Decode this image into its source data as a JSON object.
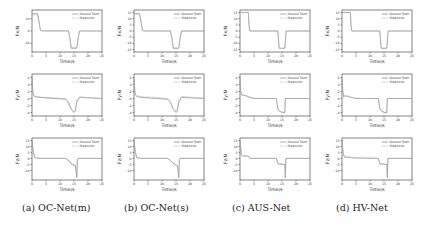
{
  "figure": {
    "captions": [
      "(a) OC-Net(m)",
      "(b) OC-Net(s)",
      "(c) AUS-Net",
      "(d) HV-Net"
    ],
    "legend": {
      "ground_truth": "Ground Truth",
      "prediction": "Prediction"
    },
    "xlabel": "Time/s",
    "row_ylabels": [
      "Fx/N",
      "Fy/N",
      "Fz/N"
    ]
  },
  "chart_data": [
    {
      "type": "line",
      "panel": "a",
      "row": 0,
      "title": "",
      "xlabel": "Time/s",
      "ylabel": "Fx/N",
      "xlim": [
        0,
        25
      ],
      "ylim": [
        -17,
        17
      ],
      "xticks": [
        0,
        5,
        10,
        15,
        20,
        25
      ],
      "yticks": [
        -10,
        0,
        10
      ],
      "series": [
        {
          "name": "Ground Truth",
          "x": [
            0,
            2,
            2.5,
            3,
            3.5,
            13,
            13.5,
            14,
            16,
            16.5,
            17,
            25
          ],
          "y": [
            14,
            14,
            8,
            0.5,
            0,
            0,
            -5,
            -14,
            -14,
            -5,
            0,
            0
          ]
        },
        {
          "name": "Prediction",
          "x": [
            0,
            2,
            2.5,
            3,
            3.5,
            13,
            13.5,
            14,
            16,
            16.5,
            17,
            25
          ],
          "y": [
            13,
            13,
            7,
            1,
            0.3,
            0.3,
            -5,
            -13,
            -13.5,
            -6,
            0.2,
            0
          ]
        }
      ]
    },
    {
      "type": "line",
      "panel": "a",
      "row": 1,
      "xlabel": "Time/s",
      "ylabel": "Fy/N",
      "xlim": [
        0,
        25
      ],
      "ylim": [
        -5,
        7
      ],
      "xticks": [
        0,
        5,
        10,
        15,
        20,
        25
      ],
      "yticks": [
        -4,
        -2,
        0,
        2,
        4,
        6
      ],
      "series": [
        {
          "name": "Ground Truth",
          "x": [
            0,
            0.3,
            0.6,
            1,
            3,
            8,
            12,
            13,
            14,
            15,
            15.5,
            16,
            17,
            25
          ],
          "y": [
            6,
            2,
            1,
            0.5,
            0.3,
            0,
            -0.2,
            -1,
            -3,
            -4,
            -3.5,
            -1,
            0.3,
            0
          ]
        },
        {
          "name": "Prediction",
          "x": [
            0,
            0.3,
            0.6,
            1,
            3,
            8,
            12,
            13,
            14,
            15,
            15.5,
            16,
            17,
            25
          ],
          "y": [
            5,
            1.5,
            0.8,
            0.7,
            0.4,
            0.2,
            0,
            -1.5,
            -3.2,
            -3.8,
            -3,
            -0.5,
            0.5,
            0
          ]
        }
      ]
    },
    {
      "type": "line",
      "panel": "a",
      "row": 2,
      "xlabel": "Time/s",
      "ylabel": "Fz/N",
      "xlim": [
        0,
        25
      ],
      "ylim": [
        -18,
        17
      ],
      "xticks": [
        0,
        5,
        10,
        15,
        20,
        25
      ],
      "yticks": [
        -10,
        -5,
        0,
        5,
        10,
        15
      ],
      "series": [
        {
          "name": "Ground Truth",
          "x": [
            0,
            0.5,
            1,
            3,
            12,
            13,
            14,
            15.5,
            16,
            16.2,
            16.5,
            25
          ],
          "y": [
            15,
            5,
            0.5,
            0,
            0,
            -1.5,
            -4,
            -6,
            -16,
            -1,
            0,
            0
          ]
        },
        {
          "name": "Prediction",
          "x": [
            0,
            0.5,
            1,
            3,
            12,
            13,
            14,
            15.5,
            16,
            16.2,
            16.5,
            25
          ],
          "y": [
            14,
            4,
            0.8,
            0.2,
            0,
            -2,
            -5,
            -7,
            -14,
            -2,
            0.2,
            0
          ]
        }
      ]
    },
    {
      "type": "line",
      "panel": "b",
      "row": 0,
      "xlabel": "Time/s",
      "ylabel": "Fx/N",
      "xlim": [
        0,
        25
      ],
      "ylim": [
        -17,
        17
      ],
      "xticks": [
        0,
        5,
        10,
        15,
        20,
        25
      ],
      "yticks": [
        -15,
        -10,
        -5,
        0,
        5,
        10,
        15
      ],
      "series": [
        {
          "name": "Ground Truth",
          "x": [
            0,
            2,
            2.5,
            3,
            3.5,
            13,
            13.5,
            14,
            16,
            16.5,
            17,
            25
          ],
          "y": [
            14,
            14,
            8,
            0.5,
            0,
            0,
            -5,
            -14,
            -14,
            -5,
            0,
            0
          ]
        },
        {
          "name": "Prediction",
          "x": [
            0,
            2,
            2.5,
            3,
            3.5,
            13,
            13.5,
            14,
            16,
            16.5,
            17,
            25
          ],
          "y": [
            13.5,
            13.5,
            7,
            0.8,
            0.2,
            0.2,
            -5,
            -13.5,
            -13.8,
            -5,
            0,
            0
          ]
        }
      ]
    },
    {
      "type": "line",
      "panel": "b",
      "row": 1,
      "xlabel": "Time/s",
      "ylabel": "Fy/N",
      "xlim": [
        0,
        25
      ],
      "ylim": [
        -5,
        7
      ],
      "xticks": [
        0,
        5,
        10,
        15,
        20,
        25
      ],
      "yticks": [
        -4,
        -2,
        0,
        2,
        4,
        6
      ],
      "series": [
        {
          "name": "Ground Truth",
          "x": [
            0,
            0.3,
            0.6,
            1,
            3,
            8,
            12,
            13,
            14,
            15,
            15.5,
            16,
            17,
            25
          ],
          "y": [
            6,
            2,
            1,
            0.5,
            0.3,
            0,
            -0.2,
            -1,
            -3,
            -4,
            -3.5,
            -1,
            0.3,
            0
          ]
        },
        {
          "name": "Prediction",
          "x": [
            0,
            0.3,
            0.6,
            1,
            3,
            8,
            12,
            13,
            14,
            15,
            15.5,
            16,
            17,
            25
          ],
          "y": [
            5.5,
            1.8,
            1,
            0.8,
            0.5,
            0.3,
            0,
            -1.2,
            -3,
            -3.6,
            -2.8,
            -0.3,
            0.6,
            0.1
          ]
        }
      ]
    },
    {
      "type": "line",
      "panel": "b",
      "row": 2,
      "xlabel": "Time/s",
      "ylabel": "Fz/N",
      "xlim": [
        0,
        25
      ],
      "ylim": [
        -18,
        17
      ],
      "xticks": [
        0,
        5,
        10,
        15,
        20,
        25
      ],
      "yticks": [
        -10,
        -5,
        0,
        5,
        10,
        15
      ],
      "series": [
        {
          "name": "Ground Truth",
          "x": [
            0,
            0.5,
            1,
            3,
            12,
            13,
            14,
            15.5,
            16,
            16.2,
            16.5,
            25
          ],
          "y": [
            15,
            5,
            0.5,
            0,
            0,
            -1.5,
            -4,
            -6,
            -16,
            -1,
            0,
            0
          ]
        },
        {
          "name": "Prediction",
          "x": [
            0,
            0.5,
            1,
            3,
            12,
            13,
            14,
            15.5,
            16,
            16.2,
            16.5,
            25
          ],
          "y": [
            14,
            4.5,
            0.6,
            0.1,
            0,
            -2,
            -4.5,
            -6.5,
            -14.5,
            -1.5,
            0.1,
            0
          ]
        }
      ]
    },
    {
      "type": "line",
      "panel": "c",
      "row": 0,
      "xlabel": "Time/s",
      "ylabel": "Fx/N",
      "xlim": [
        0,
        25
      ],
      "ylim": [
        -17,
        17
      ],
      "xticks": [
        0,
        5,
        10,
        15,
        20,
        25
      ],
      "yticks": [
        -15,
        -10,
        -5,
        0,
        5,
        10,
        15
      ],
      "series": [
        {
          "name": "Ground Truth",
          "x": [
            0,
            3,
            3.2,
            3.5,
            13.5,
            14,
            16,
            16.5,
            25
          ],
          "y": [
            15,
            15,
            5,
            0,
            0,
            -14,
            -14,
            0,
            0
          ]
        },
        {
          "name": "Prediction",
          "x": [
            0,
            3,
            3.2,
            3.5,
            13.5,
            14,
            16,
            16.5,
            25
          ],
          "y": [
            15,
            15,
            5,
            0,
            0,
            -14,
            -14,
            0,
            0
          ]
        }
      ]
    },
    {
      "type": "line",
      "panel": "c",
      "row": 1,
      "xlabel": "Time/s",
      "ylabel": "Fy/N",
      "xlim": [
        0,
        25
      ],
      "ylim": [
        -5,
        7
      ],
      "xticks": [
        0,
        5,
        10,
        15,
        20,
        25
      ],
      "yticks": [
        -4,
        -2,
        0,
        2,
        4,
        6
      ],
      "series": [
        {
          "name": "Ground Truth",
          "x": [
            0,
            0.3,
            0.6,
            1,
            2,
            3,
            4,
            5,
            8,
            13,
            13.5,
            14,
            15,
            16,
            16.2,
            25
          ],
          "y": [
            6,
            2,
            1,
            1,
            0.8,
            0.5,
            0.2,
            0,
            0,
            0,
            -3,
            -3.5,
            -4,
            -4,
            0,
            0
          ]
        },
        {
          "name": "Prediction",
          "x": [
            0,
            0.3,
            0.6,
            1,
            2,
            3,
            4,
            5,
            8,
            13,
            13.5,
            14,
            15,
            16,
            16.2,
            25
          ],
          "y": [
            5.5,
            1.5,
            1.2,
            0.8,
            1,
            0.4,
            0.3,
            0.1,
            0,
            0,
            -2.8,
            -3.6,
            -3.8,
            -4,
            0,
            0
          ]
        }
      ]
    },
    {
      "type": "line",
      "panel": "c",
      "row": 2,
      "xlabel": "Time/s",
      "ylabel": "Fz/N",
      "xlim": [
        0,
        25
      ],
      "ylim": [
        -18,
        17
      ],
      "xticks": [
        0,
        5,
        10,
        15,
        20,
        25
      ],
      "yticks": [
        -10,
        -5,
        0,
        5,
        10,
        15
      ],
      "series": [
        {
          "name": "Ground Truth",
          "x": [
            0,
            0.5,
            1,
            3,
            3.5,
            13,
            13.5,
            16,
            16.2,
            16.4,
            25
          ],
          "y": [
            15,
            3,
            2,
            2,
            0,
            0,
            -4.5,
            -5,
            -16,
            0,
            0
          ]
        },
        {
          "name": "Prediction",
          "x": [
            0,
            0.5,
            1,
            3,
            3.5,
            13,
            13.5,
            16,
            16.2,
            16.4,
            25
          ],
          "y": [
            14,
            3,
            2,
            2,
            0.2,
            0,
            -4,
            -5.5,
            -15,
            0,
            0
          ]
        }
      ]
    },
    {
      "type": "line",
      "panel": "d",
      "row": 0,
      "xlabel": "Time/s",
      "ylabel": "Fx/N",
      "xlim": [
        0,
        25
      ],
      "ylim": [
        -17,
        17
      ],
      "xticks": [
        0,
        5,
        10,
        15,
        20,
        25
      ],
      "yticks": [
        -15,
        -10,
        -5,
        0,
        5,
        10,
        15
      ],
      "series": [
        {
          "name": "Ground Truth",
          "x": [
            0,
            3,
            3.2,
            3.5,
            13.5,
            14,
            16,
            16.5,
            25
          ],
          "y": [
            15,
            15,
            5,
            0,
            0,
            -14,
            -14,
            0,
            0
          ]
        },
        {
          "name": "Prediction",
          "x": [
            0,
            3,
            3.2,
            3.5,
            13.5,
            14,
            16,
            16.5,
            25
          ],
          "y": [
            15,
            15,
            5,
            0,
            0,
            -14,
            -14,
            0,
            0
          ]
        }
      ]
    },
    {
      "type": "line",
      "panel": "d",
      "row": 1,
      "xlabel": "Time/s",
      "ylabel": "Fy/N",
      "xlim": [
        0,
        25
      ],
      "ylim": [
        -5,
        7
      ],
      "xticks": [
        0,
        5,
        10,
        15,
        20,
        25
      ],
      "yticks": [
        -4,
        -2,
        0,
        2,
        4,
        6
      ],
      "series": [
        {
          "name": "Ground Truth",
          "x": [
            0,
            0.3,
            0.6,
            1,
            2,
            3,
            4,
            5,
            8,
            13,
            13.5,
            14,
            15,
            16,
            16.2,
            25
          ],
          "y": [
            6,
            2,
            0.5,
            0.8,
            0.6,
            0.4,
            0.2,
            0,
            0,
            0,
            -3,
            -3.5,
            -4,
            -4,
            0,
            0
          ]
        },
        {
          "name": "Prediction",
          "x": [
            0,
            0.3,
            0.6,
            1,
            2,
            3,
            4,
            5,
            8,
            13,
            13.5,
            14,
            15,
            16,
            16.2,
            25
          ],
          "y": [
            5.5,
            1.5,
            0.7,
            0.6,
            0.8,
            0.3,
            0.3,
            0.1,
            0,
            0,
            -2.8,
            -3.6,
            -3.8,
            -4,
            0,
            0
          ]
        }
      ]
    },
    {
      "type": "line",
      "panel": "d",
      "row": 2,
      "xlabel": "Time/s",
      "ylabel": "Fz/N",
      "xlim": [
        0,
        25
      ],
      "ylim": [
        -18,
        17
      ],
      "xticks": [
        0,
        5,
        10,
        15,
        20,
        25
      ],
      "yticks": [
        -10,
        -5,
        0,
        5,
        10,
        15
      ],
      "series": [
        {
          "name": "Ground Truth",
          "x": [
            0,
            0.5,
            1,
            3,
            3.5,
            13,
            13.5,
            16,
            16.2,
            16.4,
            25
          ],
          "y": [
            15,
            3,
            1,
            1,
            0.5,
            0,
            -4.5,
            -5,
            -16,
            0,
            0
          ]
        },
        {
          "name": "Prediction",
          "x": [
            0,
            0.5,
            1,
            3,
            3.5,
            13,
            13.5,
            16,
            16.2,
            16.4,
            25
          ],
          "y": [
            14,
            3,
            1,
            1,
            0.5,
            0,
            -4,
            -5.5,
            -15,
            0,
            0
          ]
        }
      ]
    }
  ]
}
